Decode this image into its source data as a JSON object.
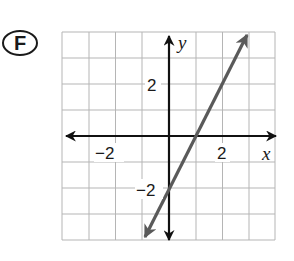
{
  "problem": {
    "label": "F"
  },
  "graph": {
    "x_axis_label": "x",
    "y_axis_label": "y",
    "tick_labels": {
      "x_neg": "−2",
      "x_pos": "2",
      "y_pos": "2",
      "y_neg": "−2"
    },
    "grid": {
      "x_range": [
        -4,
        4
      ],
      "y_range": [
        -4,
        4
      ],
      "step": 1
    },
    "line": {
      "slope": 2,
      "y_intercept": -2,
      "equation": "y = 2x - 2",
      "from": [
        -1,
        -4
      ],
      "to": [
        3,
        4
      ],
      "color": "#5a5a5a"
    },
    "colors": {
      "grid": "#b5b5b5",
      "axes": "#111111"
    }
  }
}
